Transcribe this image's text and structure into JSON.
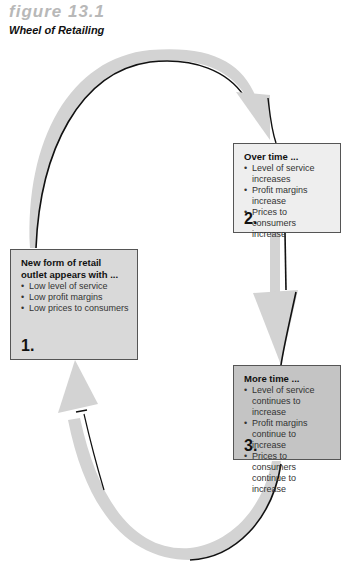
{
  "figure": {
    "number": "figure 13.1",
    "title": "Wheel of Retailing"
  },
  "colors": {
    "arrow_fill": "#d3d3d3",
    "arrow_shadow": "#111111",
    "box1_fill": "#d9d9d9",
    "box2_fill": "#eeeeee",
    "box3_fill": "#c4c4c4",
    "figure_number": "#b8b8b8"
  },
  "boxes": [
    {
      "step": "1.",
      "heading": "New form of retail outlet appears with ...",
      "bullets": [
        "Low level of service",
        "Low profit margins",
        "Low prices to consumers"
      ]
    },
    {
      "step": "2.",
      "heading": "Over time ...",
      "bullets": [
        "Level of service increases",
        "Profit margins increase",
        "Prices to consumers increase"
      ]
    },
    {
      "step": "3.",
      "heading": "More time ...",
      "bullets": [
        "Level of service continues to increase",
        "Profit margins continue to increase",
        "Prices to consumers continue to increase"
      ]
    }
  ],
  "arrows": [
    {
      "from": "1.",
      "to": "2."
    },
    {
      "from": "2.",
      "to": "3."
    },
    {
      "from": "3.",
      "to": "1."
    }
  ]
}
